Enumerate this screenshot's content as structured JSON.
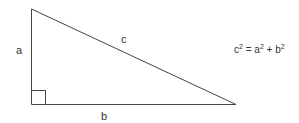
{
  "diagram": {
    "labels": {
      "a": "a",
      "b": "b",
      "c": "c"
    },
    "equation": {
      "lhs": "c",
      "lhs_exp": "2",
      "eq": " = ",
      "t1": "a",
      "t1_exp": "2",
      "plus": " + ",
      "t2": "b",
      "t2_exp": "2"
    },
    "colors": {
      "line": "#444444",
      "text": "#333333",
      "background": "#ffffff"
    }
  }
}
